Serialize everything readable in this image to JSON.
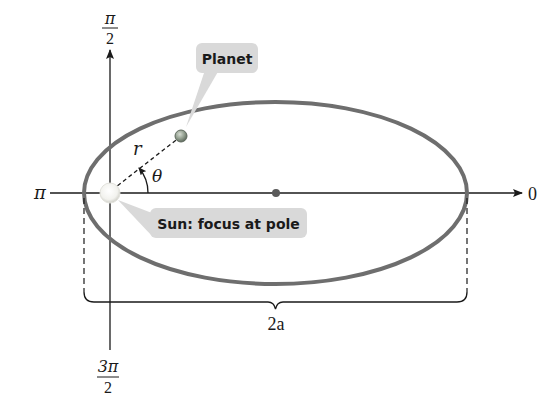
{
  "diagram": {
    "axes": {
      "top_label_num": "π",
      "top_label_den": "2",
      "left_label": "π",
      "right_label": "0",
      "bottom_label_num": "3π",
      "bottom_label_den": "2"
    },
    "labels": {
      "planet": "Planet",
      "sun": "Sun: focus at pole",
      "radius": "r",
      "angle": "θ",
      "major_axis": "2a"
    },
    "colors": {
      "ellipse": "#6e6e6e",
      "axis": "#1a1a1a",
      "callout_bg": "#d9d9d9",
      "planet_fill": "#8a9a8a",
      "sun_fill": "#f4f4f0",
      "center_dot": "#5a5a5a"
    }
  }
}
